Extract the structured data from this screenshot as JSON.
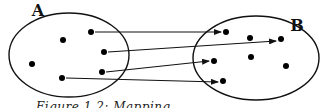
{
  "diagram": {
    "type": "set-mapping",
    "sets": [
      {
        "label": "A",
        "ellipse": {
          "cx": 69,
          "cy": 55,
          "rx": 60,
          "ry": 42
        },
        "label_pos": {
          "x": 38,
          "y": 16
        },
        "points": [
          [
            91,
            32
          ],
          [
            63,
            40
          ],
          [
            104,
            52
          ],
          [
            32,
            64
          ],
          [
            102,
            72
          ],
          [
            62,
            78
          ]
        ]
      },
      {
        "label": "B",
        "ellipse": {
          "cx": 256,
          "cy": 58,
          "rx": 63,
          "ry": 42
        },
        "label_pos": {
          "x": 297,
          "y": 31
        },
        "points": [
          [
            226,
            32
          ],
          [
            250,
            38
          ],
          [
            281,
            39
          ],
          [
            214,
            61
          ],
          [
            251,
            57
          ],
          [
            286,
            66
          ],
          [
            223,
            81
          ]
        ]
      }
    ],
    "arrows": [
      {
        "from": [
          91,
          32
        ],
        "to": [
          221,
          32
        ]
      },
      {
        "from": [
          104,
          52
        ],
        "to": [
          276,
          41
        ]
      },
      {
        "from": [
          102,
          72
        ],
        "to": [
          209,
          61
        ]
      },
      {
        "from": [
          62,
          78
        ],
        "to": [
          218,
          82
        ]
      }
    ],
    "colors": {
      "stroke": "#111111",
      "point": "#000000"
    }
  },
  "caption": "Figure 1.2: Mapping"
}
